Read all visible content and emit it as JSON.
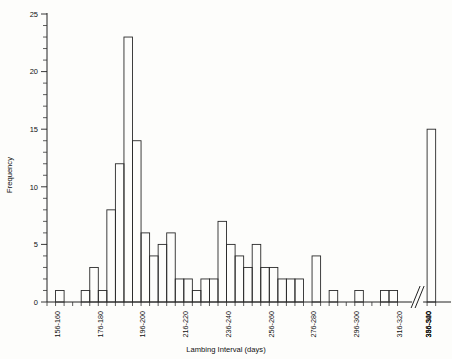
{
  "chart_data": {
    "type": "bar",
    "title": "",
    "xlabel": "Lambing Interval (days)",
    "ylabel": "Frequency",
    "ylim": [
      0,
      25
    ],
    "yticks": [
      0,
      5,
      10,
      15,
      20,
      25
    ],
    "ytick_minor_step": 1,
    "grid": false,
    "legend": null,
    "axis_break": true,
    "axis_break_note": "diagonal break on x-axis before final 386-520 category",
    "categories": [
      "151-155",
      "156-160",
      "161-165",
      "166-170",
      "171-175",
      "176-180",
      "181-185",
      "186-190",
      "191-195",
      "196-200",
      "201-205",
      "206-210",
      "211-215",
      "216-220",
      "221-225",
      "226-230",
      "231-235",
      "236-240",
      "241-245",
      "246-250",
      "251-255",
      "256-260",
      "261-265",
      "266-270",
      "271-275",
      "276-280",
      "281-285",
      "286-290",
      "291-295",
      "296-300",
      "301-305",
      "306-310",
      "311-315",
      "316-320",
      "321-325",
      "326-330",
      "331-335",
      "336-340",
      "341-345",
      "346-350",
      "351-355",
      "356-360",
      "386-520"
    ],
    "xtick_labels": [
      "156-160",
      "176-180",
      "196-200",
      "216-220",
      "236-240",
      "256-260",
      "276-280",
      "296-300",
      "316-320",
      "336-340",
      "356-360",
      "386-520"
    ],
    "values": [
      0,
      1,
      0,
      0,
      1,
      3,
      1,
      8,
      12,
      23,
      14,
      6,
      4,
      5,
      6,
      2,
      2,
      1,
      2,
      2,
      7,
      5,
      4,
      3,
      5,
      3,
      3,
      2,
      2,
      2,
      0,
      4,
      0,
      1,
      0,
      0,
      1,
      0,
      0,
      1,
      1,
      0,
      15
    ]
  }
}
